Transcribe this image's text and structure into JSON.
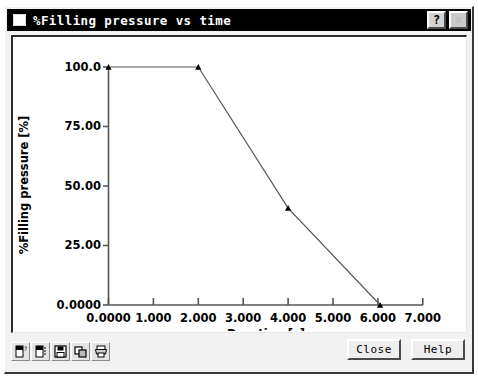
{
  "window": {
    "title": "%Filling pressure vs time",
    "sys_icon": "window-system-icon",
    "help_button": "?",
    "close_button": "×"
  },
  "toolbar": {
    "items": [
      {
        "name": "page-properties-icon",
        "tooltip": "Page properties"
      },
      {
        "name": "page-setup-icon",
        "tooltip": "Page setup"
      },
      {
        "name": "save-icon",
        "tooltip": "Save"
      },
      {
        "name": "copy-icon",
        "tooltip": "Copy"
      },
      {
        "name": "print-icon",
        "tooltip": "Print"
      }
    ]
  },
  "buttons": {
    "close": "Close",
    "help": "Help"
  },
  "chart_data": {
    "type": "line",
    "title": "%Filling pressure vs time",
    "xlabel": "Duration [s]",
    "ylabel": "%Filling pressure [%]",
    "xlim": [
      0,
      7
    ],
    "ylim": [
      0,
      100
    ],
    "grid": false,
    "legend": null,
    "xticks": [
      0,
      1,
      2,
      3,
      4,
      5,
      6,
      7
    ],
    "xticklabels": [
      "0.0000",
      "1.000",
      "2.000",
      "3.000",
      "4.000",
      "5.000",
      "6.000",
      "7.000"
    ],
    "yticks": [
      0,
      25,
      50,
      75,
      100
    ],
    "yticklabels": [
      "0.0000",
      "25.00",
      "50.00",
      "75.00",
      "100.0"
    ],
    "marker": "triangle",
    "line_color": "#555555",
    "marker_color": "#000000",
    "series": [
      {
        "name": "%Filling pressure",
        "x": [
          0.0,
          2.0,
          4.0,
          6.05
        ],
        "y": [
          100.0,
          100.0,
          40.7,
          0.0
        ]
      }
    ]
  }
}
